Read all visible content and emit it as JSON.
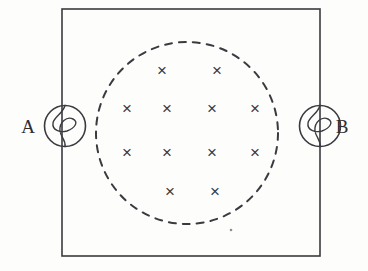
{
  "figure": {
    "type": "physics-circuit-diagram",
    "background_color": "#fdfdfc",
    "stroke_color": "#3a3a40",
    "width": 368,
    "height": 271
  },
  "circuit_loop": {
    "shape": "rectangle",
    "x": 62,
    "y": 9,
    "width": 258,
    "height": 247,
    "stroke_width": 1.6,
    "stroke_color": "#3a3a40",
    "fill": "none"
  },
  "field_region": {
    "shape": "circle",
    "style": "dashed",
    "center_x": 187,
    "center_y": 133,
    "radius": 91,
    "stroke_width": 2,
    "stroke_color": "#3a3a40",
    "dash_pattern": "7 7",
    "fill": "none",
    "meaning": "uniform magnetic field region"
  },
  "field_marks": {
    "glyph": "×",
    "symbol_name": "field-into-page-cross",
    "count": 12,
    "rows": [
      {
        "row_index": 0,
        "count": 2,
        "y": 70,
        "xs": [
          162,
          217
        ]
      },
      {
        "row_index": 1,
        "count": 4,
        "y": 108,
        "xs": [
          127,
          167,
          212,
          255
        ]
      },
      {
        "row_index": 2,
        "count": 4,
        "y": 152,
        "xs": [
          127,
          167,
          212,
          255
        ]
      },
      {
        "row_index": 3,
        "count": 2,
        "y": 191,
        "xs": [
          170,
          215
        ]
      }
    ],
    "items": [
      {
        "id": "x-r0-c0",
        "x": 162,
        "y": 70
      },
      {
        "id": "x-r0-c1",
        "x": 217,
        "y": 70
      },
      {
        "id": "x-r1-c0",
        "x": 127,
        "y": 108
      },
      {
        "id": "x-r1-c1",
        "x": 167,
        "y": 108
      },
      {
        "id": "x-r1-c2",
        "x": 212,
        "y": 108
      },
      {
        "id": "x-r1-c3",
        "x": 255,
        "y": 108
      },
      {
        "id": "x-r2-c0",
        "x": 127,
        "y": 152
      },
      {
        "id": "x-r2-c1",
        "x": 167,
        "y": 152
      },
      {
        "id": "x-r2-c2",
        "x": 212,
        "y": 152
      },
      {
        "id": "x-r2-c3",
        "x": 255,
        "y": 152
      },
      {
        "id": "x-r3-c0",
        "x": 170,
        "y": 191
      },
      {
        "id": "x-r3-c1",
        "x": 215,
        "y": 191
      }
    ]
  },
  "components": [
    {
      "id": "lamp-a",
      "symbol_name": "lamp-icon",
      "type": "lamp",
      "label": "A",
      "label_x": 28,
      "label_y": 133,
      "center_x": 65,
      "center_y": 126,
      "radius": 20.5,
      "side": "left"
    },
    {
      "id": "lamp-b",
      "symbol_name": "lamp-icon",
      "type": "lamp",
      "label": "B",
      "label_x": 342,
      "label_y": 133,
      "center_x": 320,
      "center_y": 126,
      "radius": 20.5,
      "side": "right"
    }
  ],
  "artifacts": [
    {
      "id": "scan-speck",
      "x": 231,
      "y": 230,
      "radius": 1.3
    }
  ]
}
